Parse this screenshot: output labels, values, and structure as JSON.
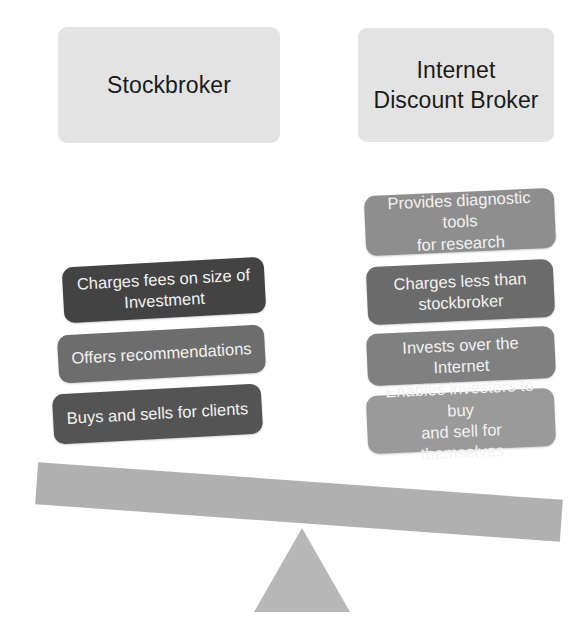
{
  "diagram": {
    "colors": {
      "header_card": "#e3e3e3",
      "header_text": "#1b1b1b",
      "chip_text": "#f2f2f2",
      "beam": "#b0b0b0",
      "fulcrum": "#b7b7b7",
      "background": "#ffffff"
    }
  },
  "headers": {
    "left": {
      "label": "Stockbroker",
      "lines": [
        "Stockbroker"
      ]
    },
    "right": {
      "label": "Internet Discount Broker",
      "lines": [
        "Internet",
        "Discount Broker"
      ]
    }
  },
  "left_column": {
    "heading": "Stockbroker",
    "chips": [
      {
        "line1": "Charges fees on size of",
        "line2": "Investment",
        "text": "Charges fees on size of Investment",
        "color": "#434343"
      },
      {
        "line1": "Offers recommendations",
        "line2": "",
        "text": "Offers recommendations",
        "color": "#6d6d6d"
      },
      {
        "line1": "Buys and sells for clients",
        "line2": "",
        "text": "Buys and sells for clients",
        "color": "#545454"
      }
    ]
  },
  "right_column": {
    "heading": "Internet Discount Broker",
    "chips": [
      {
        "line1": "Provides diagnostic tools",
        "line2": "for research",
        "text": "Provides diagnostic tools for research",
        "color": "#8e8e8e"
      },
      {
        "line1": "Charges less than",
        "line2": "stockbroker",
        "text": "Charges less than stockbroker",
        "color": "#6b6b6b"
      },
      {
        "line1": "Invests over the Internet",
        "line2": "",
        "text": "Invests over the Internet",
        "color": "#808080"
      },
      {
        "line1": "Enables investors to buy",
        "line2": "and sell for themselves",
        "text": "Enables investors to buy and sell for themselves",
        "color": "#9a9a9a"
      }
    ]
  },
  "balance": {
    "beam_name": "balance-beam",
    "fulcrum_name": "fulcrum-triangle",
    "tilt_degrees": 4.1,
    "heavier_side": "right"
  }
}
